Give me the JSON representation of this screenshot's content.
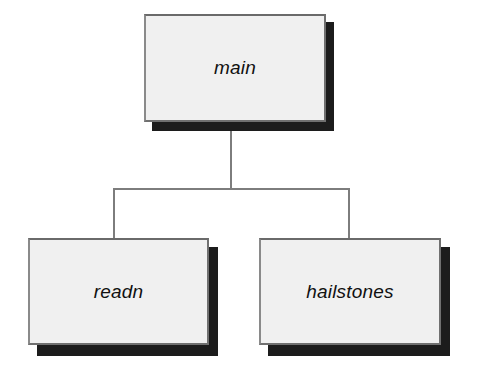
{
  "diagram": {
    "type": "structure-chart",
    "background_color": "#ffffff",
    "node_fill_color": "#f0f0f0",
    "node_border_color": "#707070",
    "node_shadow_color": "#1c1c1c",
    "connector_color": "#7d7d7d",
    "root": {
      "id": "main",
      "label": "main"
    },
    "children": [
      {
        "id": "readn",
        "label": "readn"
      },
      {
        "id": "hailstones",
        "label": "hailstones"
      }
    ],
    "edges": [
      {
        "from": "main",
        "to": "readn"
      },
      {
        "from": "main",
        "to": "hailstones"
      }
    ]
  }
}
